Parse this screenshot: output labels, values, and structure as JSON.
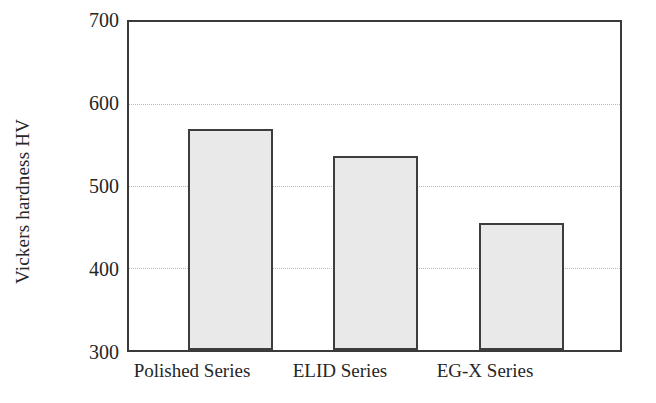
{
  "chart_data": {
    "type": "bar",
    "title": "",
    "xlabel": "",
    "ylabel": "Vickers hardness HV",
    "categories": [
      "Polished Series",
      "ELID Series",
      "EG-X Series"
    ],
    "values": [
      570,
      537,
      455
    ],
    "ylim": [
      300,
      700
    ],
    "yticks": [
      300,
      400,
      500,
      600,
      700
    ],
    "ytick_labels": [
      "300",
      "400",
      "500",
      "600",
      "700"
    ],
    "grid": true,
    "grid_axis": "y",
    "grid_style": "dotted",
    "legend": false,
    "legend_position": "none",
    "colors": {
      "bar_fill": "#e9e9e9",
      "bar_edge": "#3d3d3d",
      "axis": "#3a3a3a",
      "grid": "#b9b9b9",
      "text": "#262626",
      "background": "#ffffff"
    }
  }
}
